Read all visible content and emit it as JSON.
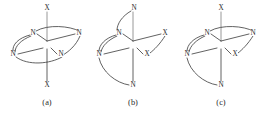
{
  "figure": {
    "background_color": "#ffffff",
    "line_color": "#3a3a3a",
    "faint_line_color": "#8c8c8c",
    "text_color": "#2b2b2b",
    "width": 267,
    "height": 115
  },
  "panels": [
    {
      "id": "panel-a",
      "caption": "(a)",
      "caption_x": 47,
      "caption_y": 103,
      "center": {
        "x": 47,
        "y": 45
      },
      "atoms": [
        {
          "name": "axial-top",
          "label": "X",
          "x": 47,
          "y": 8
        },
        {
          "name": "axial-bottom",
          "label": "X",
          "x": 47,
          "y": 85
        },
        {
          "name": "equatorial-back-left",
          "label": "N",
          "x": 33,
          "y": 33
        },
        {
          "name": "equatorial-back-right",
          "label": "N",
          "x": 79,
          "y": 33
        },
        {
          "name": "equatorial-front-left",
          "label": "N",
          "x": 13,
          "y": 54
        },
        {
          "name": "equatorial-front-right",
          "label": "N",
          "x": 61,
          "y": 54
        }
      ],
      "bonds": [
        {
          "name": "bond-center-axial-top",
          "x1": 47,
          "y1": 12,
          "x2": 47,
          "y2": 41,
          "faint": true
        },
        {
          "name": "bond-center-axial-bottom",
          "x1": 47,
          "y1": 49,
          "x2": 47,
          "y2": 81,
          "faint": false
        },
        {
          "name": "bond-center-back-left",
          "x1": 47,
          "y1": 41,
          "x2": 37,
          "y2": 34,
          "faint": false
        },
        {
          "name": "bond-center-back-right",
          "x1": 47,
          "y1": 41,
          "x2": 75,
          "y2": 34,
          "faint": false
        },
        {
          "name": "bond-center-front-left",
          "x1": 43,
          "y1": 48,
          "x2": 18,
          "y2": 54,
          "faint": false
        },
        {
          "name": "bond-center-front-right",
          "x1": 51,
          "y1": 48,
          "x2": 57,
          "y2": 54,
          "faint": false
        }
      ],
      "chelate_arcs": [
        {
          "name": "arc-back-left-to-front-left",
          "d": "M 30 35 C 18 38, 12 45, 13 51"
        },
        {
          "name": "arc-back-left-to-front-left-2",
          "d": "M 31 36 C 21 40, 15 46, 15 52"
        },
        {
          "name": "arc-back-right-to-front-right",
          "d": "M 80 36 C 76 46, 68 52, 63 55"
        },
        {
          "name": "arc-front-left-to-front-right",
          "d": "M 16 57 C 28 66, 50 64, 62 57"
        },
        {
          "name": "arc-back-left-to-back-right",
          "d": "M 36 31 C 48 24, 70 26, 79 31"
        }
      ]
    },
    {
      "id": "panel-b",
      "caption": "(b)",
      "caption_x": 133,
      "caption_y": 103,
      "center": {
        "x": 133,
        "y": 45
      },
      "atoms": [
        {
          "name": "axial-top",
          "label": "N",
          "x": 134,
          "y": 8
        },
        {
          "name": "axial-bottom",
          "label": "N",
          "x": 133,
          "y": 85
        },
        {
          "name": "equatorial-back-left",
          "label": "N",
          "x": 119,
          "y": 33
        },
        {
          "name": "equatorial-back-right",
          "label": "X",
          "x": 165,
          "y": 33
        },
        {
          "name": "equatorial-front-left",
          "label": "N",
          "x": 99,
          "y": 54
        },
        {
          "name": "equatorial-front-right",
          "label": "X",
          "x": 147,
          "y": 54
        }
      ],
      "bonds": [
        {
          "name": "bond-center-axial-top",
          "x1": 133,
          "y1": 12,
          "x2": 133,
          "y2": 41,
          "faint": true
        },
        {
          "name": "bond-center-axial-bottom",
          "x1": 133,
          "y1": 49,
          "x2": 133,
          "y2": 81,
          "faint": false
        },
        {
          "name": "bond-center-back-left",
          "x1": 133,
          "y1": 41,
          "x2": 123,
          "y2": 34,
          "faint": false
        },
        {
          "name": "bond-center-back-right",
          "x1": 133,
          "y1": 41,
          "x2": 161,
          "y2": 34,
          "faint": false
        },
        {
          "name": "bond-center-front-left",
          "x1": 129,
          "y1": 48,
          "x2": 104,
          "y2": 54,
          "faint": false
        },
        {
          "name": "bond-center-front-right",
          "x1": 137,
          "y1": 48,
          "x2": 143,
          "y2": 54,
          "faint": false
        }
      ],
      "chelate_arcs": [
        {
          "name": "arc-back-left-to-front-left",
          "d": "M 116 35 C 105 38, 99 45, 99 51"
        },
        {
          "name": "arc-back-left-to-front-left-2",
          "d": "M 117 36 C 108 40, 102 46, 101 52"
        },
        {
          "name": "arc-back-right-to-front-right",
          "d": "M 165 36 C 160 44, 154 50, 150 53"
        },
        {
          "name": "arc-axial-top-to-back-left",
          "d": "M 131 11 C 122 16, 117 24, 117 30"
        },
        {
          "name": "arc-front-left-to-axial-bottom",
          "d": "M 99 58 C 102 72, 116 83, 129 85"
        }
      ]
    },
    {
      "id": "panel-c",
      "caption": "(c)",
      "caption_x": 221,
      "caption_y": 103,
      "center": {
        "x": 221,
        "y": 45
      },
      "atoms": [
        {
          "name": "axial-top",
          "label": "X",
          "x": 221,
          "y": 8
        },
        {
          "name": "axial-bottom",
          "label": "N",
          "x": 221,
          "y": 85
        },
        {
          "name": "equatorial-back-left",
          "label": "N",
          "x": 207,
          "y": 33
        },
        {
          "name": "equatorial-back-right",
          "label": "N",
          "x": 253,
          "y": 33
        },
        {
          "name": "equatorial-front-left",
          "label": "N",
          "x": 187,
          "y": 54
        },
        {
          "name": "equatorial-front-right",
          "label": "X",
          "x": 235,
          "y": 54
        }
      ],
      "bonds": [
        {
          "name": "bond-center-axial-top",
          "x1": 221,
          "y1": 12,
          "x2": 221,
          "y2": 41,
          "faint": true
        },
        {
          "name": "bond-center-axial-bottom",
          "x1": 221,
          "y1": 49,
          "x2": 221,
          "y2": 81,
          "faint": false
        },
        {
          "name": "bond-center-back-left",
          "x1": 221,
          "y1": 41,
          "x2": 211,
          "y2": 34,
          "faint": false
        },
        {
          "name": "bond-center-back-right",
          "x1": 221,
          "y1": 41,
          "x2": 249,
          "y2": 34,
          "faint": false
        },
        {
          "name": "bond-center-front-left",
          "x1": 217,
          "y1": 48,
          "x2": 192,
          "y2": 54,
          "faint": false
        },
        {
          "name": "bond-center-front-right",
          "x1": 225,
          "y1": 48,
          "x2": 231,
          "y2": 54,
          "faint": false
        }
      ],
      "chelate_arcs": [
        {
          "name": "arc-back-left-to-front-left",
          "d": "M 204 35 C 193 38, 187 45, 187 51"
        },
        {
          "name": "arc-back-left-to-front-left-2",
          "d": "M 205 36 C 196 40, 190 46, 189 52"
        },
        {
          "name": "arc-back-right-to-front-right",
          "d": "M 253 36 C 248 44, 242 50, 238 53"
        },
        {
          "name": "arc-back-left-to-back-right",
          "d": "M 210 31 C 222 24, 244 26, 253 31"
        },
        {
          "name": "arc-front-left-to-axial-bottom",
          "d": "M 187 58 C 190 72, 204 83, 217 85"
        }
      ]
    }
  ]
}
